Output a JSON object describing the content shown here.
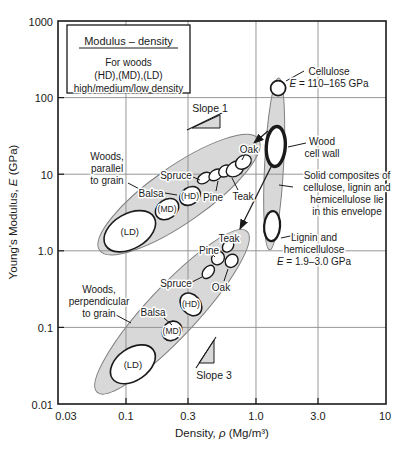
{
  "figure": {
    "width": 406,
    "height": 454,
    "ink": "#1a1a1a",
    "grid_color": "#8c8c8c",
    "envelope_fill": "#d8d8d8",
    "envelope_stroke": "#7f7f7f",
    "plot": {
      "left": 58,
      "top": 21,
      "right": 386,
      "bottom": 404
    }
  },
  "title_box": {
    "title": "Modulus – density",
    "lines": [
      "For woods",
      "(HD),(MD),(LD)",
      "high/medium/low density"
    ],
    "rect": [
      67,
      25,
      190,
      93
    ]
  },
  "chart_data": {
    "type": "scatter",
    "xscale": "log",
    "yscale": "log",
    "xlim": [
      0.03,
      10
    ],
    "ylim": [
      0.01,
      1000
    ],
    "grid": true,
    "xlabel_parts": {
      "pre": "Density, ",
      "sym": "ρ",
      "post": " (Mg/m³)"
    },
    "ylabel_parts": {
      "pre": "Young's Modulus, ",
      "sym": "E",
      "post": " (GPa)"
    },
    "xticks": [
      0.03,
      0.1,
      0.3,
      1.0,
      3.0,
      10
    ],
    "xtick_labels": [
      "0.03",
      "0.1",
      "0.3",
      "1.0",
      "3.0",
      "10"
    ],
    "yticks": [
      1000,
      100,
      10,
      1.0,
      0.1,
      0.01
    ],
    "ytick_labels": [
      "1000",
      "100",
      "10",
      "1.0",
      "0.1",
      "0.01"
    ],
    "grid_x": [
      0.1,
      0.3,
      1.0,
      3.0
    ],
    "grid_y": [
      0.1,
      1.0,
      10,
      100
    ],
    "envelopes": [
      {
        "name": "woods-parallel-envelope",
        "rho": 0.256,
        "E": 5.4,
        "rx": 97,
        "ry": 28,
        "rot": -35
      },
      {
        "name": "woods-perpendicular-envelope",
        "rho": 0.226,
        "E": 0.16,
        "rx": 110,
        "ry": 25,
        "rot": -47
      },
      {
        "name": "solid-composites-envelope",
        "rho": 1.38,
        "E": 13.6,
        "rx": 9.5,
        "ry": 86,
        "rot": 3
      }
    ],
    "ellipses": [
      {
        "name": "ld-parallel",
        "group": "parallel",
        "label": "(LD)",
        "label_size": 9.5,
        "rho": 0.107,
        "E": 1.8,
        "rx": 28,
        "ry": 17.5,
        "rot": -30,
        "sw": 1.6
      },
      {
        "name": "md-parallel",
        "group": "parallel",
        "label": "(MD)",
        "label_size": 8.5,
        "rho": 0.207,
        "E": 3.5,
        "rx": 12.5,
        "ry": 9.5,
        "rot": -35,
        "sw": 1.6
      },
      {
        "name": "hd-parallel",
        "group": "parallel",
        "label": "(HD)",
        "label_size": 8.5,
        "rho": 0.311,
        "E": 5.2,
        "rx": 11,
        "ry": 8.5,
        "rot": -35,
        "sw": 1.6
      },
      {
        "name": "spruce-parallel",
        "group": "parallel",
        "rho": 0.4,
        "E": 8.9,
        "rx": 7.5,
        "ry": 4.8,
        "rot": -35,
        "sw": 1.4
      },
      {
        "name": "pine-parallel",
        "group": "parallel",
        "rho": 0.49,
        "E": 9.8,
        "rx": 7.5,
        "ry": 5,
        "rot": -35,
        "sw": 1.4
      },
      {
        "name": "teak-inner-parallel",
        "group": "parallel",
        "rho": 0.58,
        "E": 11.0,
        "rx": 7,
        "ry": 5.5,
        "rot": -35,
        "sw": 1.4
      },
      {
        "name": "teak-parallel",
        "group": "parallel",
        "rho": 0.69,
        "E": 11.7,
        "rx": 9.5,
        "ry": 7,
        "rot": -35,
        "sw": 1.4
      },
      {
        "name": "oak-parallel",
        "group": "parallel",
        "rho": 0.8,
        "E": 14.4,
        "rx": 8.5,
        "ry": 6.5,
        "rot": -35,
        "sw": 1.4
      },
      {
        "name": "ld-perpendicular",
        "group": "perpendicular",
        "label": "(LD)",
        "label_size": 9.5,
        "rho": 0.113,
        "E": 0.033,
        "rx": 25,
        "ry": 16,
        "rot": -35,
        "sw": 1.6
      },
      {
        "name": "md-perpendicular",
        "group": "perpendicular",
        "label": "(MD)",
        "label_size": 8.5,
        "rho": 0.226,
        "E": 0.09,
        "rx": 10.5,
        "ry": 9,
        "rot": -45,
        "sw": 1.6
      },
      {
        "name": "hd-perpendicular",
        "group": "perpendicular",
        "label": "(HD)",
        "label_size": 8.5,
        "rho": 0.316,
        "E": 0.2,
        "rx": 9.5,
        "ry": 12.5,
        "rot": -40,
        "sw": 1.6
      },
      {
        "name": "spruce-perpendicular",
        "group": "perpendicular",
        "rho": 0.43,
        "E": 0.53,
        "rx": 7.5,
        "ry": 5,
        "rot": -50,
        "sw": 1.4
      },
      {
        "name": "pine-perpendicular",
        "group": "perpendicular",
        "rho": 0.51,
        "E": 0.8,
        "rx": 7,
        "ry": 6,
        "rot": -50,
        "sw": 1.4
      },
      {
        "name": "teak-perpendicular",
        "group": "perpendicular",
        "rho": 0.61,
        "E": 1.15,
        "rx": 6.5,
        "ry": 5,
        "rot": -50,
        "sw": 1.4
      },
      {
        "name": "oak-perpendicular",
        "group": "perpendicular",
        "rho": 0.65,
        "E": 0.74,
        "rx": 7,
        "ry": 6,
        "rot": -50,
        "sw": 1.4
      },
      {
        "name": "cellulose",
        "group": "composites",
        "rho": 1.48,
        "E": 133,
        "rx": 7.5,
        "ry": 7.5,
        "rot": 0,
        "sw": 1.8
      },
      {
        "name": "wood-cell-wall",
        "group": "composites",
        "rho": 1.42,
        "E": 23,
        "rx": 9.5,
        "ry": 20,
        "rot": 4,
        "sw": 3.4
      },
      {
        "name": "lignin-hemicellulose",
        "group": "composites",
        "rho": 1.33,
        "E": 2.1,
        "rx": 8,
        "ry": 15,
        "rot": 4,
        "sw": 2.2
      }
    ]
  },
  "annotations": [
    {
      "name": "woods-parallel-label",
      "lines": [
        "Woods,",
        "parallel",
        "to grain"
      ],
      "x": 107,
      "y": 156,
      "leader": [
        [
          128,
          183
        ],
        [
          149,
          194
        ]
      ]
    },
    {
      "name": "woods-perpendicular-label",
      "lines": [
        "Woods,",
        "perpendicular",
        "to grain"
      ],
      "x": 99,
      "y": 289,
      "leader": [
        [
          116,
          315
        ],
        [
          131,
          323
        ]
      ]
    },
    {
      "name": "balsa-parallel-label",
      "lines": [
        "Balsa"
      ],
      "x": 151,
      "y": 193,
      "leader": [
        [
          165,
          193
        ],
        [
          177,
          195
        ]
      ]
    },
    {
      "name": "balsa-perpendicular-label",
      "lines": [
        "Balsa"
      ],
      "x": 153,
      "y": 312,
      "leader": [
        [
          164,
          318
        ],
        [
          172,
          325
        ]
      ]
    },
    {
      "name": "spruce-parallel-label",
      "lines": [
        "Spruce"
      ],
      "x": 176,
      "y": 175,
      "leader": [
        [
          193,
          177
        ],
        [
          200,
          180
        ]
      ]
    },
    {
      "name": "pine-parallel-label",
      "lines": [
        "Pine"
      ],
      "x": 213,
      "y": 197,
      "leader": [
        [
          216,
          191
        ],
        [
          218,
          181
        ]
      ]
    },
    {
      "name": "teak-parallel-label",
      "lines": [
        "Teak"
      ],
      "x": 243,
      "y": 196,
      "leader": [
        [
          238,
          190
        ],
        [
          232,
          178
        ]
      ]
    },
    {
      "name": "oak-parallel-label",
      "lines": [
        "Oak"
      ],
      "x": 249,
      "y": 149,
      "leader": [
        [
          245,
          154
        ],
        [
          242,
          160
        ]
      ]
    },
    {
      "name": "spruce-perpendicular-label",
      "lines": [
        "Spruce"
      ],
      "x": 176,
      "y": 283,
      "leader": [
        [
          192,
          282
        ],
        [
          202,
          277
        ]
      ]
    },
    {
      "name": "pine-perpendicular-label",
      "lines": [
        "Pine"
      ],
      "x": 209,
      "y": 250,
      "leader": [
        [
          212,
          254
        ],
        [
          215,
          257
        ]
      ]
    },
    {
      "name": "teak-perpendicular-label",
      "lines": [
        "Teak"
      ],
      "x": 229,
      "y": 238
    },
    {
      "name": "oak-perpendicular-label",
      "lines": [
        "Oak"
      ],
      "x": 221,
      "y": 287,
      "leader": [
        [
          224,
          281
        ],
        [
          228,
          269
        ]
      ]
    },
    {
      "name": "cellulose-label",
      "lines": [
        "Cellulose",
        "E = 110–165 GPa"
      ],
      "x": 329,
      "y": 71,
      "leader": [
        [
          286,
          81
        ],
        [
          304,
          71
        ]
      ]
    },
    {
      "name": "wood-cell-wall-label",
      "lines": [
        "Wood",
        "cell wall"
      ],
      "x": 322,
      "y": 141,
      "leader": [
        [
          288,
          147
        ],
        [
          306,
          143
        ]
      ]
    },
    {
      "name": "solid-composites-label",
      "lines": [
        "Solid composites of",
        "cellulose, lignin and",
        "hemicellulose lie",
        "in this envelope"
      ],
      "x": 347,
      "y": 175,
      "leader": [
        [
          279,
          185
        ],
        [
          293,
          187
        ]
      ]
    },
    {
      "name": "lignin-label",
      "lines": [
        "Lignin and",
        "hemicellulose",
        "E = 1.9–3.0 GPa"
      ],
      "x": 314,
      "y": 237,
      "leader": [
        [
          281,
          238
        ],
        [
          295,
          235
        ]
      ]
    }
  ],
  "slopes": [
    {
      "name": "slope-1",
      "label": "Slope 1",
      "text": [
        210,
        108
      ],
      "tri": [
        [
          192,
          128
        ],
        [
          220,
          128
        ],
        [
          220,
          115
        ]
      ],
      "line": [
        [
          187,
          130
        ],
        [
          226,
          111
        ]
      ]
    },
    {
      "name": "slope-3",
      "label": "Slope 3",
      "text": [
        214,
        375
      ],
      "tri": [
        [
          199,
          363
        ],
        [
          214,
          363
        ],
        [
          214,
          340
        ]
      ],
      "line": [
        [
          196,
          368
        ],
        [
          216,
          337
        ]
      ]
    }
  ],
  "arrows": [
    {
      "name": "arrow-to-parallel-envelope",
      "from": [
        268,
        131
      ],
      "to": [
        254,
        143
      ]
    },
    {
      "name": "arrow-to-perpendicular-envelope",
      "from": [
        273,
        163
      ],
      "to": [
        240,
        229
      ]
    }
  ]
}
